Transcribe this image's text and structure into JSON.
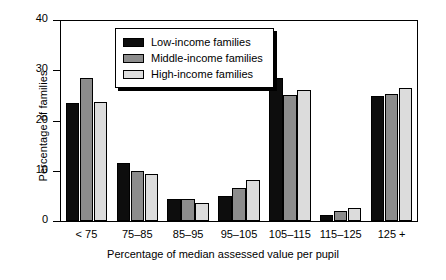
{
  "chart_data": {
    "type": "bar",
    "title": "",
    "xlabel": "Percentage of median assessed value per pupil",
    "ylabel": "Percentage of families",
    "categories": [
      "< 75",
      "75–85",
      "85–95",
      "95–105",
      "105–115",
      "115–125",
      "125 +"
    ],
    "series": [
      {
        "name": "Low-income families",
        "color": "#0d0d0d",
        "values": [
          23.5,
          11.6,
          4.3,
          5.0,
          28.4,
          1.2,
          24.9
        ]
      },
      {
        "name": "Middle-income families",
        "color": "#8c8c8c",
        "values": [
          28.4,
          10.0,
          4.3,
          6.6,
          25.0,
          2.0,
          25.3
        ]
      },
      {
        "name": "High-income families",
        "color": "#dcdcdc",
        "values": [
          23.6,
          9.3,
          3.5,
          8.2,
          26.0,
          2.6,
          26.5
        ]
      }
    ],
    "ylim": [
      0,
      40
    ],
    "yticks": [
      0,
      10,
      20,
      30,
      40
    ],
    "ytick_labels": [
      "0",
      "10",
      "20",
      "30",
      "40"
    ],
    "grid": false,
    "legend_position": "upper-center"
  },
  "legend": {
    "items": [
      {
        "label": "Low-income families"
      },
      {
        "label": "Middle-income families"
      },
      {
        "label": "High-income families"
      }
    ]
  }
}
